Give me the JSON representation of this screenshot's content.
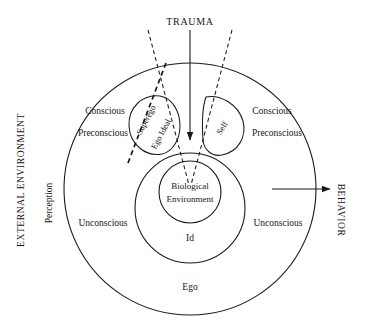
{
  "figure": {
    "background": "#ffffff",
    "stroke_color": "#1a1a1a",
    "text_color": "#161616"
  },
  "labels": {
    "trauma": "TRAUMA",
    "behavior": "BEHAVIOR",
    "external_environment": "EXTERNAL ENVIRONMENT",
    "perception": "Perception",
    "conscious_left": "Conscious",
    "preconscious_left": "Preconscious",
    "unconscious_left": "Unconscious",
    "conscious_right": "Conscious",
    "preconscious_right": "Preconscious",
    "unconscious_right": "Unconscious",
    "superego": "Superego",
    "ego_ideal": "Ego Ideal",
    "self": "Self",
    "biological": "Biological",
    "environment": "Environment",
    "id": "Id",
    "ego": "Ego"
  },
  "icons": {
    "trauma_arrow": "down-arrow-icon",
    "behavior_arrow": "right-arrow-icon",
    "split_left": "dashed-split-line-icon",
    "split_right": "dashed-split-line-icon",
    "superego_divider": "dashed-divider-icon"
  },
  "geometry": {
    "ego_circle": {
      "cx": 190,
      "cy": 189,
      "r": 126
    },
    "id_circle": {
      "cx": 190,
      "cy": 208,
      "r": 55
    },
    "biological_circle": {
      "cx": 190,
      "cy": 192,
      "r": 31
    },
    "superego_blob": {
      "cx": 152,
      "cy": 125,
      "rx": 25,
      "ry": 30
    },
    "self_blob": {
      "cx": 225,
      "cy": 125,
      "rx": 21,
      "ry": 30
    },
    "trauma_arrow": {
      "x": 190,
      "y1": 30,
      "y2": 140
    },
    "behavior_arrow": {
      "y": 189,
      "x1": 272,
      "x2": 330
    }
  }
}
